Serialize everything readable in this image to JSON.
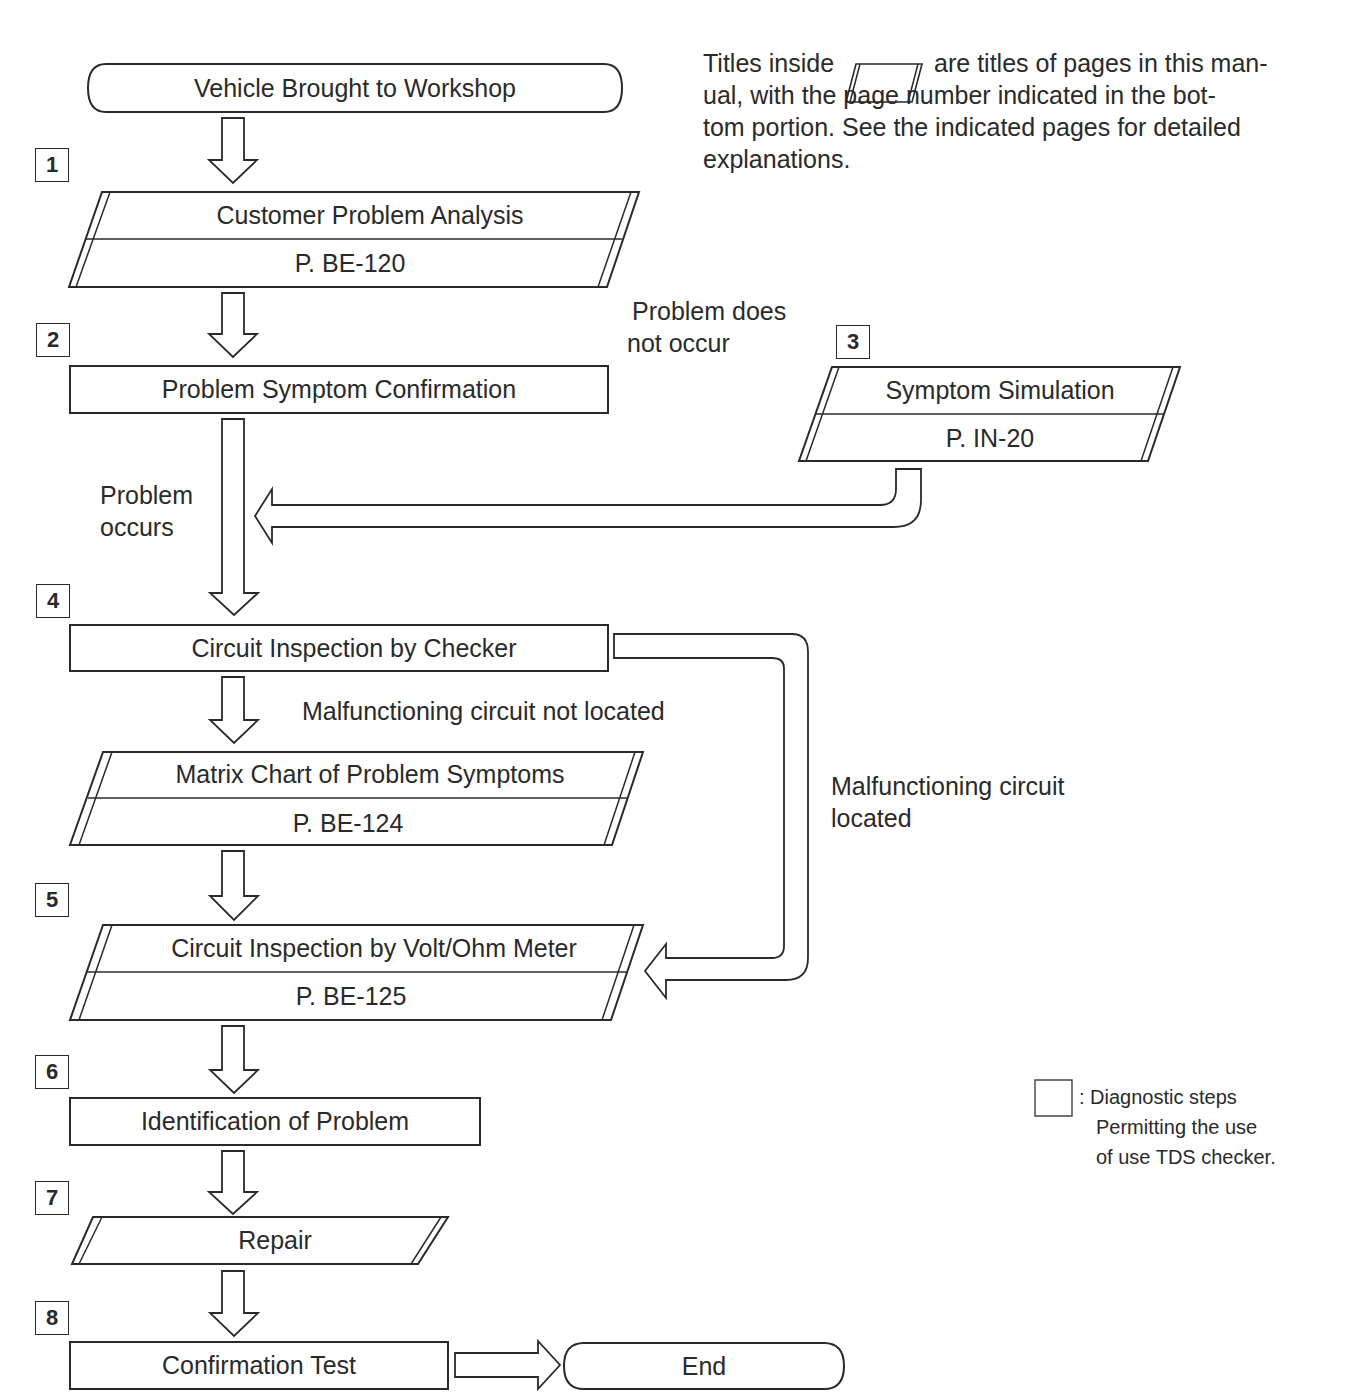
{
  "note": {
    "prefix": "Titles inside",
    "icon": "parallelogram-icon",
    "line1_rest": "are titles of pages in this man-",
    "line2": "ual, with the page number indicated in the bot-",
    "line3": "tom portion. See the indicated pages for detailed",
    "line4": "explanations."
  },
  "flow": {
    "start": "Vehicle Brought to Workshop",
    "end": "End",
    "steps": [
      {
        "number": "1",
        "title": "Customer Problem Analysis",
        "page": "P. BE-120",
        "shape": "page-reference"
      },
      {
        "number": "2",
        "title": "Problem Symptom Confirmation",
        "shape": "process"
      },
      {
        "number": "3",
        "title": "Symptom Simulation",
        "page": "P. IN-20",
        "shape": "page-reference"
      },
      {
        "number": "4",
        "title": "Circuit Inspection by Checker",
        "shape": "process"
      },
      {
        "number": "",
        "title": "Matrix Chart of Problem Symptoms",
        "page": "P. BE-124",
        "shape": "page-reference"
      },
      {
        "number": "5",
        "title": "Circuit Inspection by Volt/Ohm Meter",
        "page": "P. BE-125",
        "shape": "page-reference"
      },
      {
        "number": "6",
        "title": "Identification of Problem",
        "shape": "process"
      },
      {
        "number": "7",
        "title": "Repair",
        "shape": "page-reference"
      },
      {
        "number": "8",
        "title": "Confirmation Test",
        "shape": "process"
      }
    ],
    "branch_labels": {
      "problem_does_not_occur_1": "Problem does",
      "problem_does_not_occur_2": "not occur",
      "problem_occurs_1": "Problem",
      "problem_occurs_2": "occurs",
      "circuit_not_located": "Malfunctioning circuit not located",
      "circuit_located_1": "Malfunctioning circuit",
      "circuit_located_2": "located"
    }
  },
  "legend": {
    "icon": "square-box-icon",
    "line1": ": Diagnostic steps",
    "line2": "Permitting the use",
    "line3": "of use TDS checker."
  },
  "colors": {
    "ink": "#2a2a2a",
    "paper": "#ffffff"
  }
}
